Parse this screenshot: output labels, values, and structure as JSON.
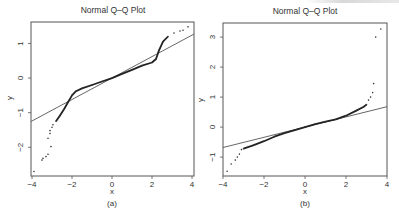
{
  "chart_data": [
    {
      "type": "scatter",
      "panel": "(a)",
      "title": "Normal Q–Q Plot",
      "xlabel": "x",
      "ylabel": "y",
      "caption": "(a)",
      "xlim": [
        -4.05,
        4.1
      ],
      "ylim": [
        -2.83,
        1.62
      ],
      "xticks": [
        -4,
        -2,
        0,
        2,
        4
      ],
      "yticks": [
        -2,
        -1,
        0,
        1
      ],
      "grid": false,
      "reference_line": {
        "slope": 0.31,
        "intercept": 0.0
      },
      "points": [
        [
          -3.9,
          -2.7
        ],
        [
          -3.5,
          -2.37
        ],
        [
          -3.45,
          -2.32
        ],
        [
          -3.3,
          -2.27
        ],
        [
          -3.2,
          -2.2
        ],
        [
          -3.05,
          -1.98
        ],
        [
          -3.2,
          -1.74
        ],
        [
          -3.1,
          -1.6
        ],
        [
          -3.1,
          -1.52
        ],
        [
          -3.0,
          -1.42
        ],
        [
          -2.95,
          -1.35
        ],
        [
          -2.8,
          -1.25
        ],
        [
          -2.6,
          -1.08
        ],
        [
          -2.4,
          -0.9
        ],
        [
          -2.2,
          -0.7
        ],
        [
          -2.0,
          -0.5
        ],
        [
          -1.8,
          -0.38
        ],
        [
          -1.5,
          -0.3
        ],
        [
          -1.0,
          -0.2
        ],
        [
          -0.5,
          -0.1
        ],
        [
          0.0,
          0.0
        ],
        [
          0.5,
          0.12
        ],
        [
          1.0,
          0.24
        ],
        [
          1.5,
          0.36
        ],
        [
          2.0,
          0.45
        ],
        [
          2.2,
          0.55
        ],
        [
          2.35,
          0.8
        ],
        [
          2.55,
          1.05
        ],
        [
          2.8,
          1.2
        ],
        [
          3.1,
          1.3
        ],
        [
          3.4,
          1.36
        ],
        [
          3.55,
          1.38
        ],
        [
          3.8,
          1.48
        ]
      ]
    },
    {
      "type": "scatter",
      "panel": "(b)",
      "title": "Normal Q–Q Plot",
      "xlabel": "x",
      "ylabel": "y",
      "caption": "(b)",
      "xlim": [
        -4.0,
        4.0
      ],
      "ylim": [
        -1.63,
        3.47
      ],
      "xticks": [
        -4,
        -2,
        0,
        2,
        4
      ],
      "yticks": [
        -1,
        0,
        1,
        2,
        3
      ],
      "grid": false,
      "reference_line": {
        "slope": 0.17,
        "intercept": 0.0
      },
      "points": [
        [
          -3.8,
          -1.47
        ],
        [
          -3.6,
          -1.23
        ],
        [
          -3.4,
          -1.1
        ],
        [
          -3.3,
          -1.0
        ],
        [
          -3.2,
          -0.9
        ],
        [
          -3.1,
          -0.75
        ],
        [
          -3.0,
          -0.72
        ],
        [
          -2.5,
          -0.6
        ],
        [
          -2.0,
          -0.47
        ],
        [
          -1.5,
          -0.32
        ],
        [
          -1.0,
          -0.2
        ],
        [
          -0.5,
          -0.1
        ],
        [
          0.0,
          0.0
        ],
        [
          0.5,
          0.1
        ],
        [
          1.0,
          0.18
        ],
        [
          1.5,
          0.26
        ],
        [
          2.0,
          0.38
        ],
        [
          2.5,
          0.55
        ],
        [
          2.85,
          0.67
        ],
        [
          3.0,
          0.75
        ],
        [
          3.1,
          0.9
        ],
        [
          3.2,
          1.0
        ],
        [
          3.3,
          1.15
        ],
        [
          3.35,
          1.45
        ],
        [
          3.45,
          3.0
        ],
        [
          3.7,
          3.27
        ]
      ]
    }
  ]
}
